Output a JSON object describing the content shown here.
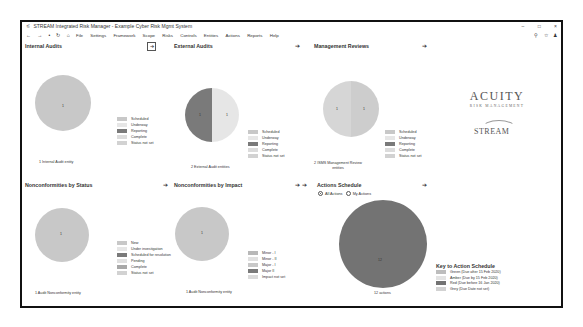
{
  "window": {
    "title": "STREAM Integrated Risk Manager - Example Cyber Risk Mgmt System",
    "controls": [
      "–",
      "□",
      "×"
    ]
  },
  "menubar": {
    "nav": [
      "←",
      "→",
      "•",
      "↻",
      "⌂"
    ],
    "items": [
      "File",
      "Settings",
      "Framework",
      "Scope",
      "Risks",
      "Controls",
      "Entities",
      "Actions",
      "Reports",
      "Help"
    ],
    "tools": [
      "search-icon",
      "star-icon",
      "user-icon"
    ]
  },
  "colors": {
    "scheduled": "#c8c8c8",
    "underway": "#e6e6e6",
    "reporting": "#7a7a7a",
    "complete": "#dcdcdc",
    "status_not_set": "#d2d2d2",
    "actions_red": "#737373",
    "frame": "#111111"
  },
  "panels": {
    "internal_audits": {
      "title": "Internal Audits",
      "footer": "1 Internal Audit entity",
      "legend": [
        "Scheduled",
        "Underway",
        "Reporting",
        "Complete",
        "Status not set"
      ],
      "slice_labels": [
        "1"
      ]
    },
    "external_audits": {
      "title": "External Audits",
      "footer": "2 External Audit entities",
      "legend": [
        "Scheduled",
        "Underway",
        "Reporting",
        "Complete",
        "Status not set"
      ],
      "slice_labels": [
        "1",
        "1"
      ]
    },
    "management_reviews": {
      "title": "Management Reviews",
      "footer": "2 ISMS Management Review entities",
      "legend": [
        "Scheduled",
        "Underway",
        "Reporting",
        "Complete",
        "Status not set"
      ],
      "slice_labels": [
        "1",
        "1"
      ]
    },
    "nc_status": {
      "title": "Nonconformities by Status",
      "footer": "1 Audit Nonconformity entity",
      "legend": [
        "New",
        "Under investigation",
        "Scheduled for resolution",
        "Pending",
        "Complete",
        "Status not set"
      ],
      "slice_labels": [
        "1"
      ]
    },
    "nc_impact": {
      "title": "Nonconformities by Impact",
      "footer": "1 Audit Nonconformity entity",
      "legend": [
        "Minor - I",
        "Minor - II",
        "Major - I",
        "Major II",
        "Impact not set"
      ],
      "slice_labels": [
        "1"
      ]
    },
    "actions_schedule": {
      "title": "Actions Schedule",
      "radio_all": "All Actions",
      "radio_mine": "My Actions",
      "footer": "12 actions",
      "slice_labels": [
        "12"
      ]
    }
  },
  "key": {
    "title": "Key to Action Schedule",
    "items": [
      "Green (Due after 15 Feb 2020)",
      "Amber (Due by 15 Feb 2020)",
      "Red (Due before 16 Jan 2020)",
      "Grey (Due Date not set)"
    ]
  },
  "logos": {
    "acuity": "ACUITY",
    "acuity_sub": "RISK MANAGEMENT",
    "stream": "STREAM"
  },
  "arrow": "➔"
}
